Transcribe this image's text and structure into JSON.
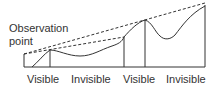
{
  "diagram": {
    "title_label": {
      "line1": "Observation",
      "line2": "point"
    },
    "segments": [
      {
        "label": "Visible"
      },
      {
        "label": "Invisible"
      },
      {
        "label": "Visible"
      },
      {
        "label": "Invisible"
      }
    ],
    "colors": {
      "line": "#333333",
      "background": "#ffffff"
    }
  }
}
